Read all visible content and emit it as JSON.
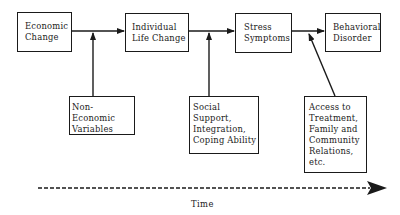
{
  "diagram": {
    "main_flow": [
      {
        "id": "economic-change",
        "label": "Economic\nChange"
      },
      {
        "id": "individual-life-change",
        "label": "Individual\nLife Change"
      },
      {
        "id": "stress-symptoms",
        "label": "Stress\nSymptoms"
      },
      {
        "id": "behavioral-disorder",
        "label": "Behavioral\nDisorder"
      }
    ],
    "moderators": [
      {
        "id": "non-economic-variables",
        "label": "Non-Economic\nVariables",
        "acts_on": "economic-change -> individual-life-change"
      },
      {
        "id": "social-support",
        "label": "Social Support,\nIntegration,\nCoping Ability",
        "acts_on": "individual-life-change -> stress-symptoms"
      },
      {
        "id": "access-to-treatment",
        "label": "Access to\nTreatment,\nFamily and\nCommunity\nRelations,\netc.",
        "acts_on": "stress-symptoms -> behavioral-disorder"
      }
    ],
    "time_axis": {
      "label": "Time"
    },
    "colors": {
      "stroke": "#1a1a1a",
      "background": "#ffffff"
    }
  }
}
